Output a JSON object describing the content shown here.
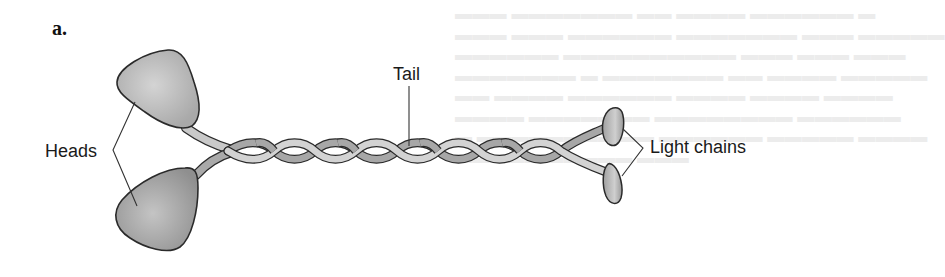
{
  "figure": {
    "panel_label": "a.",
    "labels": {
      "heads": "Heads",
      "tail": "Tail",
      "light_chains": "Light chains"
    },
    "components": [
      {
        "name": "head-upper",
        "type": "globular head"
      },
      {
        "name": "head-lower",
        "type": "globular head"
      },
      {
        "name": "tail",
        "type": "coiled-coil twisted tail"
      },
      {
        "name": "light-chain-upper",
        "type": "light chain"
      },
      {
        "name": "light-chain-lower",
        "type": "light chain"
      }
    ],
    "colors": {
      "outline": "#2a2a2a",
      "head_fill": "#b9b9b9",
      "head_fill_dark": "#9a9a9a",
      "strand_light": "#d2d2d2",
      "strand_dark": "#a8a8a8",
      "leader_line": "#333333"
    }
  }
}
